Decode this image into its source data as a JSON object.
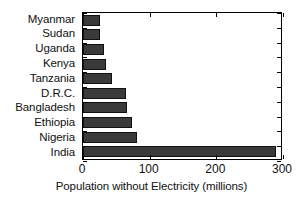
{
  "chart_data": {
    "type": "bar",
    "orientation": "horizontal",
    "title": "",
    "xlabel": "Population without Electricity (millions)",
    "ylabel": "",
    "categories": [
      "Myanmar",
      "Sudan",
      "Uganda",
      "Kenya",
      "Tanzania",
      "D.R.C.",
      "Bangladesh",
      "Ethiopia",
      "Nigeria",
      "India"
    ],
    "values": [
      25,
      25,
      31,
      35,
      43,
      65,
      66,
      73,
      81,
      290
    ],
    "xlim": [
      0,
      300
    ],
    "xticks": [
      0,
      100,
      200,
      300
    ],
    "xtick_labels": [
      "0",
      "100",
      "200",
      "300"
    ],
    "grid": false,
    "legend": null,
    "bar_color": "#3a3a3a",
    "axis_color": "#000000",
    "background": "#ffffff"
  }
}
